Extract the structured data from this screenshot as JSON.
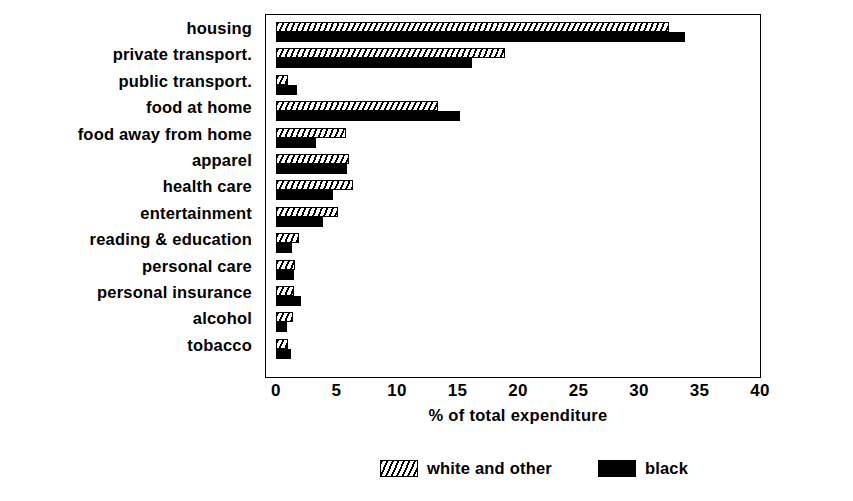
{
  "chart_data": {
    "type": "bar",
    "orientation": "horizontal",
    "title": "",
    "xlabel": "% of total expenditure",
    "ylabel": "",
    "xlim": [
      0,
      40
    ],
    "xticks": [
      0,
      5,
      10,
      15,
      20,
      25,
      30,
      35,
      40
    ],
    "grid": false,
    "legend_position": "bottom-center",
    "categories": [
      "housing",
      "private transport.",
      "public transport.",
      "food at home",
      "food away from home",
      "apparel",
      "health care",
      "entertainment",
      "reading & education",
      "personal care",
      "personal insurance",
      "alcohol",
      "tobacco"
    ],
    "series": [
      {
        "name": "white and other",
        "pattern": "diagonal-hatch",
        "color": "#ffffff",
        "values": [
          32.5,
          18.9,
          1.0,
          13.4,
          5.8,
          6.0,
          6.4,
          5.1,
          1.9,
          1.6,
          1.5,
          1.4,
          1.0
        ]
      },
      {
        "name": "black",
        "pattern": "solid",
        "color": "#000000",
        "values": [
          33.8,
          16.2,
          1.7,
          15.2,
          3.3,
          5.9,
          4.7,
          3.9,
          1.3,
          1.5,
          2.1,
          0.9,
          1.2
        ]
      }
    ]
  },
  "axis": {
    "tick_labels": [
      "0",
      "5",
      "10",
      "15",
      "20",
      "25",
      "30",
      "35",
      "40"
    ],
    "x_axis_title": "% of total expenditure"
  },
  "legend": {
    "items": [
      {
        "label": "white and other",
        "swatch": "hatched-swatch"
      },
      {
        "label": "black",
        "swatch": "black-swatch"
      }
    ]
  }
}
